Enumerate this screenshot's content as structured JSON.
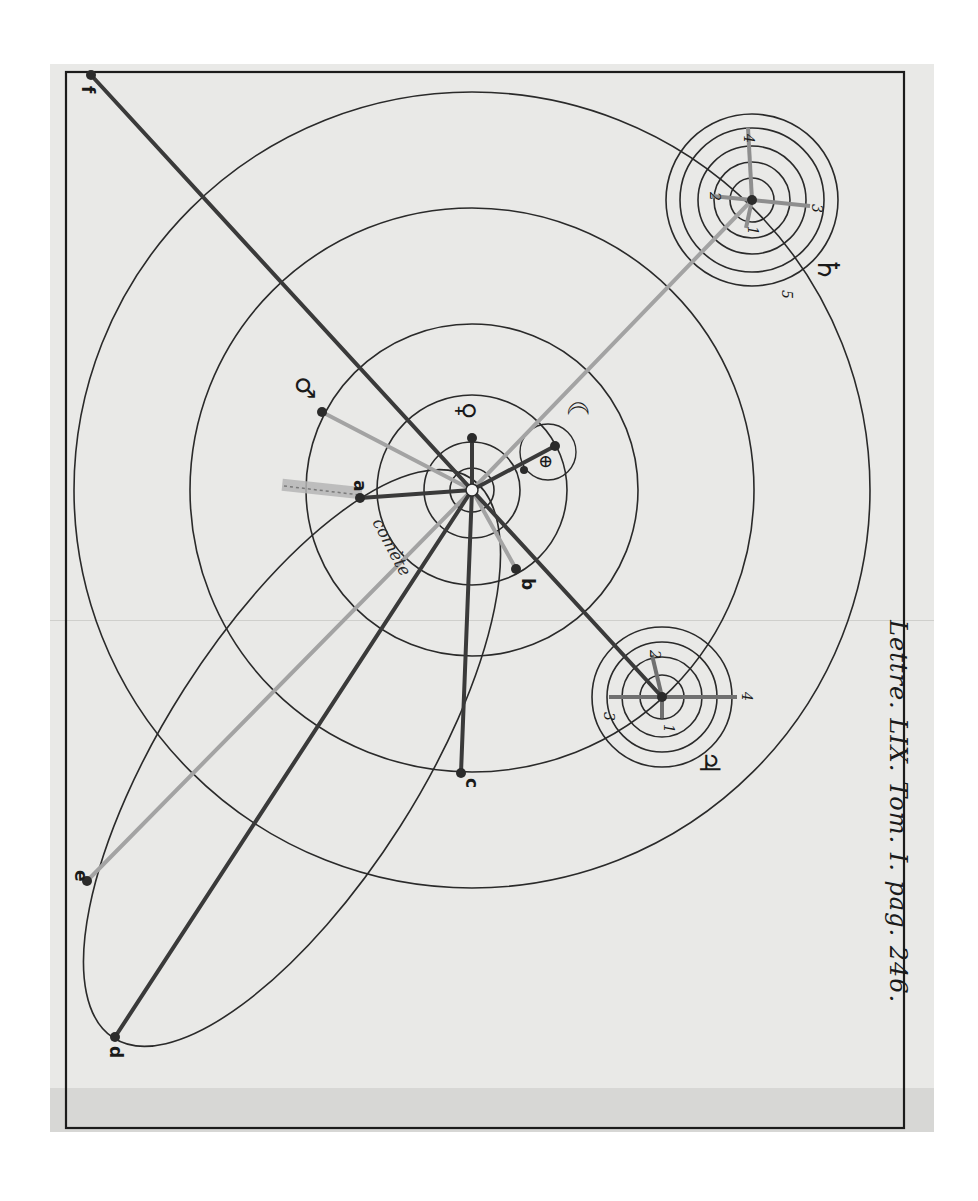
{
  "caption": "Lettre. LIX. Tom. I. pag. 246.",
  "plate": {
    "sun": {
      "x": 472,
      "y": 490,
      "symbol": "☉"
    },
    "orbits": [
      {
        "name": "mercury-orbit",
        "r": 22
      },
      {
        "name": "venus-orbit",
        "r": 48
      },
      {
        "name": "earth-orbit",
        "r": 95
      },
      {
        "name": "mars-orbit",
        "r": 166
      },
      {
        "name": "jupiter-orbit",
        "r": 282
      },
      {
        "name": "saturn-orbit",
        "r": 398
      }
    ],
    "planets": [
      {
        "name": "mercury",
        "symbol": "☿",
        "x": 472,
        "y": 438
      },
      {
        "name": "venus",
        "symbol": "♀",
        "x": 472,
        "y": 438
      },
      {
        "name": "earth",
        "symbol": "♁",
        "x": 555,
        "y": 446
      },
      {
        "name": "moon",
        "symbol": "☾"
      },
      {
        "name": "mars",
        "symbol": "♂",
        "x": 322,
        "y": 412
      },
      {
        "name": "jupiter",
        "symbol": "♃",
        "x": 662,
        "y": 670
      },
      {
        "name": "saturn",
        "symbol": "♄",
        "x": 752,
        "y": 200
      }
    ],
    "symbols": {
      "venus": "♀",
      "earth": "⊕",
      "moon": "☾",
      "mars": "♂",
      "jupiter": "♃",
      "saturn": "♄",
      "mercury": "☿"
    },
    "comet_label": "comète",
    "comet_points": [
      {
        "label": "a",
        "x": 360,
        "y": 498
      },
      {
        "label": "b",
        "x": 516,
        "y": 569
      },
      {
        "label": "c",
        "x": 461,
        "y": 773
      },
      {
        "label": "d",
        "x": 115,
        "y": 1037
      },
      {
        "label": "e",
        "x": 87,
        "y": 881
      },
      {
        "label": "f",
        "x": 91,
        "y": 75
      }
    ],
    "jupiter_satellites": [
      "1",
      "2",
      "3",
      "4"
    ],
    "saturn_satellites": [
      "1",
      "2",
      "3",
      "4",
      "5"
    ]
  }
}
